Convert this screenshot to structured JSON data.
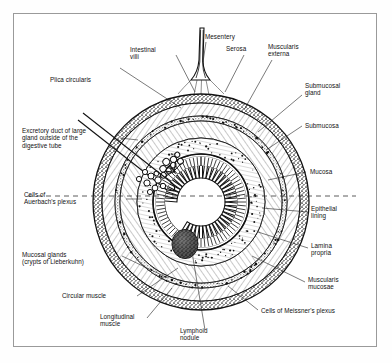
{
  "figure": {
    "type": "anatomical-cross-section-diagram",
    "frame_color": "#9a9a9a",
    "ink_color": "#111111",
    "background_color": "#ffffff"
  },
  "labels": {
    "mesentery": "Mesentery",
    "serosa": "Serosa",
    "muscularis_externa": "Muscularis\nexterna",
    "submucosal_gland": "Submucosal\ngland",
    "submucosa": "Submucosa",
    "mucosa": "Mucosa",
    "epithelial_lining": "Epithelial\nlining",
    "lamina_propria": "Lamina\npropria",
    "muscularis_mucosae": "Muscularis\nmucosae",
    "meissners_plexus": "Cells of Meissner's plexus",
    "lymphoid_nodule": "Lymphoid\nnodule",
    "longitudinal_muscle": "Longitudinal\nmuscle",
    "circular_muscle": "Circular muscle",
    "mucosal_glands": "Mucosal glands\n(crypts of Lieberkuhn)",
    "auerbachs_plexus": "Cells of\nAuerbach's plexus",
    "excretory_duct": "Excretory duct of large\ngland outside of the\ndigestive tube",
    "plica_circularis": "Plica circularis",
    "intestinal_villi": "Intestinal\nvilli"
  },
  "structures": {
    "lumen": "lumen",
    "villi": "intestinal-villi",
    "nodule": "lymphoid-nodule",
    "duct": "excretory-duct",
    "midline": "horizontal-dashed-midline"
  }
}
